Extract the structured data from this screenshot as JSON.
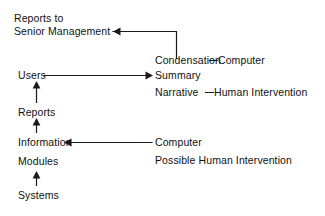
{
  "diagram": {
    "background_color": "#ffffff",
    "line_color": "#1a1a1a",
    "text_color": "#111111",
    "left_column": {
      "reports_to": "Reports to",
      "senior_management": "Senior Management",
      "users": "Users",
      "reports": "Reports",
      "information": "Information",
      "modules": "Modules",
      "systems": "Systems"
    },
    "right_column": {
      "condensation": "Condensation",
      "condensation_source": "Computer",
      "summary": "Summary",
      "narrative": "Narrative",
      "narrative_source": "Human Intervention",
      "computer": "Computer",
      "possible_human_intervention": "Possible Human Intervention"
    },
    "connectors": [
      {
        "name": "senior-management-feedback",
        "from": "Condensation / Summary / Narrative group",
        "to": "Senior Management",
        "direction": "left",
        "shape": "elbow-up-left"
      },
      {
        "name": "users-to-summary",
        "from": "Users",
        "to": "Summary",
        "direction": "right",
        "shape": "horizontal"
      },
      {
        "name": "computer-to-information",
        "from": "Computer",
        "to": "Information",
        "direction": "left",
        "shape": "horizontal"
      },
      {
        "name": "reports-to-users",
        "from": "Reports",
        "to": "Users",
        "direction": "up",
        "shape": "vertical"
      },
      {
        "name": "information-to-reports",
        "from": "Information",
        "to": "Reports",
        "direction": "up",
        "shape": "vertical"
      },
      {
        "name": "systems-to-modules",
        "from": "Systems",
        "to": "Modules",
        "direction": "up",
        "shape": "vertical"
      }
    ]
  }
}
